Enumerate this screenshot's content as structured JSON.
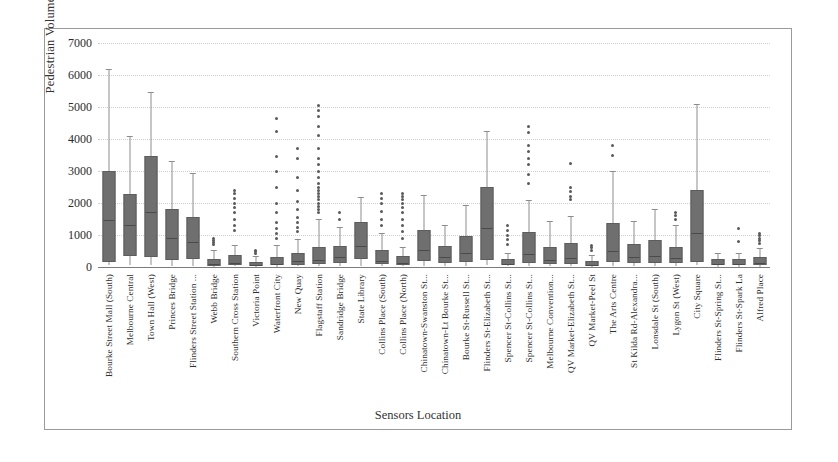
{
  "chart_data": {
    "type": "box",
    "title": "",
    "xlabel": "Sensors Location",
    "ylabel": "Pedestrian Volume",
    "ylim": [
      0,
      7000
    ],
    "yticks": [
      0,
      1000,
      2000,
      3000,
      4000,
      5000,
      6000,
      7000
    ],
    "grid": true,
    "legend": null,
    "categories": [
      "Bourke Street Mall (South)",
      "Melbourne Central",
      "Town Hall (West)",
      "Princes Bridge",
      "Flinders Street Station ...",
      "Webb Bridge",
      "Southern Cross Station",
      "Victoria Point",
      "Waterfront City",
      "New Quay",
      "Flagstaff Station",
      "Sandridge Bridge",
      "State Library",
      "Collins Place (South)",
      "Collins Place (North)",
      "Chinatown-Swanston St...",
      "Chinatown-Lt Bourke St...",
      "Bourke St-Russell St...",
      "Flinders St-Elizabeth St...",
      "Spencer St-Collins St...",
      "Spencer St-Collins St...",
      "Melbourne Convention...",
      "QV Market-Elizabeth St...",
      "QV Market-Peel St",
      "The Arts Centre",
      "St Kilda Rd-Alexandra...",
      "Lonsdale St (South)",
      "Lygon St (West)",
      "City Square",
      "Flinders St-Spring St...",
      "Flinders St-Spark La",
      "Alfred Place"
    ],
    "boxes": [
      {
        "label": "Bourke Street Mall (South)",
        "min": 50,
        "q1": 150,
        "median": 1500,
        "q3": 3000,
        "max": 6200,
        "outliers": []
      },
      {
        "label": "Melbourne Central",
        "min": 60,
        "q1": 350,
        "median": 1350,
        "q3": 2280,
        "max": 4080,
        "outliers": []
      },
      {
        "label": "Town Hall (West)",
        "min": 70,
        "q1": 300,
        "median": 1750,
        "q3": 3480,
        "max": 5480,
        "outliers": []
      },
      {
        "label": "Princes Bridge",
        "min": 40,
        "q1": 230,
        "median": 950,
        "q3": 1800,
        "max": 3300,
        "outliers": []
      },
      {
        "label": "Flinders Street Station ...",
        "min": 40,
        "q1": 250,
        "median": 820,
        "q3": 1560,
        "max": 2930,
        "outliers": []
      },
      {
        "label": "Webb Bridge",
        "min": 10,
        "q1": 40,
        "median": 110,
        "q3": 260,
        "max": 520,
        "outliers": [
          700,
          760,
          820,
          880
        ]
      },
      {
        "label": "Southern Cross Station",
        "min": 20,
        "q1": 60,
        "median": 170,
        "q3": 360,
        "max": 700,
        "outliers": [
          1150,
          1300,
          1500,
          1700,
          1850,
          2000,
          2150,
          2300,
          2400
        ]
      },
      {
        "label": "Victoria Point",
        "min": 10,
        "q1": 30,
        "median": 80,
        "q3": 170,
        "max": 330,
        "outliers": [
          430,
          480,
          520
        ]
      },
      {
        "label": "Waterfront City",
        "min": 10,
        "q1": 50,
        "median": 140,
        "q3": 300,
        "max": 700,
        "outliers": [
          900,
          1050,
          1200,
          1400,
          1700,
          2000,
          2500,
          3000,
          3450,
          4250,
          4650
        ]
      },
      {
        "label": "New Quay",
        "min": 20,
        "q1": 70,
        "median": 210,
        "q3": 430,
        "max": 870,
        "outliers": [
          1100,
          1250,
          1400,
          1550,
          1800,
          2050,
          2400,
          2800,
          3400,
          3700
        ]
      },
      {
        "label": "Flagstaff Station",
        "min": 20,
        "q1": 80,
        "median": 240,
        "q3": 640,
        "max": 1500,
        "outliers": [
          1700,
          1800,
          1900,
          2000,
          2100,
          2200,
          2300,
          2400,
          2500,
          2600,
          2800,
          3000,
          3200,
          3400,
          3700,
          4100,
          4400,
          4700,
          4900,
          5050
        ]
      },
      {
        "label": "Sandridge Bridge",
        "min": 30,
        "q1": 120,
        "median": 330,
        "q3": 650,
        "max": 1250,
        "outliers": [
          1500,
          1700
        ]
      },
      {
        "label": "State Library",
        "min": 40,
        "q1": 260,
        "median": 700,
        "q3": 1420,
        "max": 2200,
        "outliers": []
      },
      {
        "label": "Collins Place (South)",
        "min": 20,
        "q1": 80,
        "median": 220,
        "q3": 530,
        "max": 1050,
        "outliers": [
          1300,
          1500,
          1750,
          2000,
          2150,
          2300
        ]
      },
      {
        "label": "Collins Place (North)",
        "min": 20,
        "q1": 60,
        "median": 150,
        "q3": 330,
        "max": 620,
        "outliers": [
          900,
          1100,
          1300,
          1500,
          1700,
          1850,
          2000,
          2100,
          2200,
          2300
        ]
      },
      {
        "label": "Chinatown-Swanston St...",
        "min": 40,
        "q1": 200,
        "median": 570,
        "q3": 1150,
        "max": 2250,
        "outliers": []
      },
      {
        "label": "Chinatown-Lt Bourke St...",
        "min": 30,
        "q1": 110,
        "median": 330,
        "q3": 660,
        "max": 1300,
        "outliers": []
      },
      {
        "label": "Bourke St-Russell St...",
        "min": 40,
        "q1": 170,
        "median": 470,
        "q3": 960,
        "max": 1950,
        "outliers": []
      },
      {
        "label": "Flinders St-Elizabeth St...",
        "min": 50,
        "q1": 230,
        "median": 1250,
        "q3": 2500,
        "max": 4250,
        "outliers": []
      },
      {
        "label": "Spencer St-Collins St...",
        "min": 20,
        "q1": 60,
        "median": 140,
        "q3": 260,
        "max": 450,
        "outliers": [
          700,
          850,
          1000,
          1150,
          1300
        ]
      },
      {
        "label": "Spencer St-Collins St...",
        "min": 30,
        "q1": 130,
        "median": 430,
        "q3": 1100,
        "max": 2100,
        "outliers": [
          2600,
          2900,
          3200,
          3400,
          3600,
          3800,
          4200,
          4400
        ]
      },
      {
        "label": "Melbourne Convention...",
        "min": 20,
        "q1": 90,
        "median": 260,
        "q3": 620,
        "max": 1450,
        "outliers": []
      },
      {
        "label": "QV Market-Elizabeth St...",
        "min": 20,
        "q1": 100,
        "median": 300,
        "q3": 740,
        "max": 1600,
        "outliers": [
          2100,
          2200,
          2350,
          2500,
          3250
        ]
      },
      {
        "label": "QV Market-Peel St",
        "min": 10,
        "q1": 40,
        "median": 100,
        "q3": 190,
        "max": 380,
        "outliers": [
          520,
          600,
          680
        ]
      },
      {
        "label": "The Arts Centre",
        "min": 40,
        "q1": 150,
        "median": 520,
        "q3": 1380,
        "max": 3000,
        "outliers": [
          3500,
          3800
        ]
      },
      {
        "label": "St Kilda Rd-Alexandra...",
        "min": 30,
        "q1": 110,
        "median": 330,
        "q3": 720,
        "max": 1450,
        "outliers": []
      },
      {
        "label": "Lonsdale St (South)",
        "min": 30,
        "q1": 140,
        "median": 380,
        "q3": 850,
        "max": 1800,
        "outliers": []
      },
      {
        "label": "Lygon St (West)",
        "min": 30,
        "q1": 130,
        "median": 300,
        "q3": 620,
        "max": 1300,
        "outliers": [
          1500,
          1600,
          1700
        ]
      },
      {
        "label": "City Square",
        "min": 50,
        "q1": 150,
        "median": 1100,
        "q3": 2400,
        "max": 5100,
        "outliers": []
      },
      {
        "label": "Flinders St-Spring St...",
        "min": 10,
        "q1": 50,
        "median": 130,
        "q3": 240,
        "max": 430,
        "outliers": []
      },
      {
        "label": "Flinders St-Spark La",
        "min": 10,
        "q1": 50,
        "median": 130,
        "q3": 250,
        "max": 450,
        "outliers": [
          800,
          1200
        ]
      },
      {
        "label": "Alfred Place",
        "min": 10,
        "q1": 60,
        "median": 160,
        "q3": 320,
        "max": 600,
        "outliers": [
          750,
          830,
          900,
          980,
          1050
        ]
      }
    ]
  },
  "style": {
    "box_fill": "#6f6f6f",
    "box_edge": "#5d5d5d",
    "whisker": "#8d8d8d",
    "outlier": "#5a5a5a",
    "grid": "#cfcfcf",
    "axis": "#7b7b7b",
    "text": "#2b2b2b",
    "background": "#ffffff"
  }
}
